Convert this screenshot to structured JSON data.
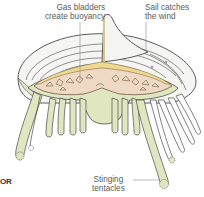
{
  "diagram": {
    "labels": {
      "gas_bladders": [
        "Gas bladders",
        "create buoyancy"
      ],
      "sail": [
        "Sail catches",
        "the wind"
      ],
      "tentacles": [
        "Stinging",
        "tentacles"
      ]
    },
    "edge_fragment": "OR",
    "colors": {
      "sail_fill": "#f5f6f3",
      "sail_stroke": "#4a4a4a",
      "body_fill": "#dfe6c0",
      "bladder_fill": "#efd9c4",
      "bladder_stroke": "#6d5a42",
      "crest_fill": "#f0d98e",
      "tentacle_fill": "#dfe6c0",
      "label_text": "#5a5a5a",
      "leader_line": "#8a8a8a"
    }
  }
}
